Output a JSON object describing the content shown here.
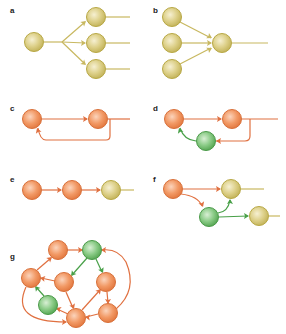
{
  "colors": {
    "yellow_fill": "#d8cc7a",
    "yellow_stroke": "#b8a845",
    "yellow_edge": "#c8b860",
    "orange_fill": "#f0925a",
    "orange_stroke": "#d8703a",
    "orange_edge": "#e07040",
    "green_fill": "#7cc47a",
    "green_stroke": "#4a9a48",
    "green_edge": "#48a048"
  },
  "panels": [
    {
      "id": "a",
      "label": "a",
      "label_pos": [
        10,
        14
      ],
      "title": "Single-input module (divergence)"
    },
    {
      "id": "b",
      "label": "b",
      "label_pos": [
        153,
        14
      ],
      "title": "Multi-input module (convergence)"
    },
    {
      "id": "c",
      "label": "c",
      "label_pos": [
        10,
        112
      ],
      "title": "Feedback loop"
    },
    {
      "id": "d",
      "label": "d",
      "label_pos": [
        153,
        112
      ],
      "title": "Feedback with inhibitory interneuron"
    },
    {
      "id": "e",
      "label": "e",
      "label_pos": [
        10,
        183
      ],
      "title": "Feed-forward chain"
    },
    {
      "id": "f",
      "label": "f",
      "label_pos": [
        153,
        183
      ],
      "title": "Feed-forward with interneuron"
    },
    {
      "id": "g",
      "label": "g",
      "label_pos": [
        10,
        260
      ],
      "title": "Recurrent network"
    }
  ],
  "nodes": [
    {
      "id": "a0",
      "panel": "a",
      "type": "yellow",
      "x": 34,
      "y": 42
    },
    {
      "id": "a1",
      "panel": "a",
      "type": "yellow",
      "x": 96,
      "y": 17
    },
    {
      "id": "a2",
      "panel": "a",
      "type": "yellow",
      "x": 96,
      "y": 43
    },
    {
      "id": "a3",
      "panel": "a",
      "type": "yellow",
      "x": 96,
      "y": 69
    },
    {
      "id": "b1",
      "panel": "b",
      "type": "yellow",
      "x": 172,
      "y": 17
    },
    {
      "id": "b2",
      "panel": "b",
      "type": "yellow",
      "x": 172,
      "y": 43
    },
    {
      "id": "b3",
      "panel": "b",
      "type": "yellow",
      "x": 172,
      "y": 69
    },
    {
      "id": "b0",
      "panel": "b",
      "type": "yellow",
      "x": 222,
      "y": 43
    },
    {
      "id": "c1",
      "panel": "c",
      "type": "orange",
      "x": 32,
      "y": 119
    },
    {
      "id": "c2",
      "panel": "c",
      "type": "orange",
      "x": 98,
      "y": 119
    },
    {
      "id": "d1",
      "panel": "d",
      "type": "orange",
      "x": 174,
      "y": 119
    },
    {
      "id": "d2",
      "panel": "d",
      "type": "orange",
      "x": 232,
      "y": 119
    },
    {
      "id": "d3",
      "panel": "d",
      "type": "green",
      "x": 206,
      "y": 141
    },
    {
      "id": "e1",
      "panel": "e",
      "type": "orange",
      "x": 32,
      "y": 190
    },
    {
      "id": "e2",
      "panel": "e",
      "type": "orange",
      "x": 72,
      "y": 190
    },
    {
      "id": "e3",
      "panel": "e",
      "type": "yellow",
      "x": 111,
      "y": 190
    },
    {
      "id": "f1",
      "panel": "f",
      "type": "orange",
      "x": 173,
      "y": 189
    },
    {
      "id": "f2",
      "panel": "f",
      "type": "yellow",
      "x": 231,
      "y": 189
    },
    {
      "id": "f3",
      "panel": "f",
      "type": "green",
      "x": 209,
      "y": 217
    },
    {
      "id": "f4",
      "panel": "f",
      "type": "yellow",
      "x": 259,
      "y": 216
    },
    {
      "id": "g1",
      "panel": "g",
      "type": "orange",
      "x": 58,
      "y": 250
    },
    {
      "id": "g2",
      "panel": "g",
      "type": "green",
      "x": 92,
      "y": 250
    },
    {
      "id": "g3",
      "panel": "g",
      "type": "orange",
      "x": 31,
      "y": 278
    },
    {
      "id": "g4",
      "panel": "g",
      "type": "orange",
      "x": 64,
      "y": 282
    },
    {
      "id": "g5",
      "panel": "g",
      "type": "orange",
      "x": 106,
      "y": 282
    },
    {
      "id": "g6",
      "panel": "g",
      "type": "green",
      "x": 48,
      "y": 305
    },
    {
      "id": "g7",
      "panel": "g",
      "type": "orange",
      "x": 76,
      "y": 318
    },
    {
      "id": "g8",
      "panel": "g",
      "type": "orange",
      "x": 108,
      "y": 313
    }
  ],
  "edges": [
    {
      "panel": "a",
      "color": "yellow",
      "d": "M44,42 L62,42",
      "head": null
    },
    {
      "panel": "a",
      "color": "yellow",
      "d": "M62,42 L85,22",
      "head": {
        "x": 86,
        "y": 21,
        "angle": -40
      }
    },
    {
      "panel": "a",
      "color": "yellow",
      "d": "M62,42 L85,43",
      "head": {
        "x": 86,
        "y": 43,
        "angle": 0
      }
    },
    {
      "panel": "a",
      "color": "yellow",
      "d": "M62,42 L85,64",
      "head": {
        "x": 86,
        "y": 65,
        "angle": 40
      }
    },
    {
      "panel": "a",
      "color": "yellow",
      "d": "M106,17 L130,17",
      "head": null
    },
    {
      "panel": "a",
      "color": "yellow",
      "d": "M106,43 L130,43",
      "head": null
    },
    {
      "panel": "a",
      "color": "yellow",
      "d": "M106,69 L130,69",
      "head": null
    },
    {
      "panel": "b",
      "color": "yellow",
      "d": "M180,22 L211,38",
      "head": {
        "x": 212,
        "y": 38,
        "angle": 28
      }
    },
    {
      "panel": "b",
      "color": "yellow",
      "d": "M182,43 L211,43",
      "head": {
        "x": 212,
        "y": 43,
        "angle": 0
      }
    },
    {
      "panel": "b",
      "color": "yellow",
      "d": "M180,64 L211,48",
      "head": {
        "x": 212,
        "y": 48,
        "angle": -28
      }
    },
    {
      "panel": "b",
      "color": "yellow",
      "d": "M232,43 L268,43",
      "head": null
    },
    {
      "panel": "c",
      "color": "orange",
      "d": "M42,119 L87,119",
      "head": {
        "x": 88,
        "y": 119,
        "angle": 0
      }
    },
    {
      "panel": "c",
      "color": "orange",
      "d": "M108,119 L130,119",
      "head": null
    },
    {
      "panel": "c",
      "color": "orange",
      "d": "M110,119 L110,136 Q110,140 106,140 L46,140 Q40,140 38,128",
      "head": {
        "x": 37,
        "y": 128,
        "angle": -110
      }
    },
    {
      "panel": "d",
      "color": "orange",
      "d": "M184,119 L221,119",
      "head": {
        "x": 222,
        "y": 119,
        "angle": 0
      }
    },
    {
      "panel": "d",
      "color": "orange",
      "d": "M242,119 L278,119",
      "head": null
    },
    {
      "panel": "d",
      "color": "orange",
      "d": "M250,119 L250,136 Q250,141 245,141 L216,141",
      "head": {
        "x": 216,
        "y": 141,
        "angle": 180
      }
    },
    {
      "panel": "d",
      "color": "green",
      "d": "M196,141 Q184,140 180,128",
      "head": {
        "x": 179,
        "y": 128,
        "angle": -110
      }
    },
    {
      "panel": "e",
      "color": "orange",
      "d": "M42,190 L61,190",
      "head": {
        "x": 62,
        "y": 190,
        "angle": 0
      }
    },
    {
      "panel": "e",
      "color": "orange",
      "d": "M82,190 L100,190",
      "head": {
        "x": 101,
        "y": 190,
        "angle": 0
      }
    },
    {
      "panel": "e",
      "color": "yellow",
      "d": "M121,190 L134,190",
      "head": null
    },
    {
      "panel": "f",
      "color": "orange",
      "d": "M183,189 L220,189",
      "head": {
        "x": 221,
        "y": 189,
        "angle": 0
      }
    },
    {
      "panel": "f",
      "color": "yellow",
      "d": "M241,189 L264,189",
      "head": null
    },
    {
      "panel": "f",
      "color": "orange",
      "d": "M181,194 Q198,196 202,206",
      "head": {
        "x": 203,
        "y": 207,
        "angle": 70
      }
    },
    {
      "panel": "f",
      "color": "green",
      "d": "M218,213 Q228,212 230,200",
      "head": {
        "x": 230,
        "y": 199,
        "angle": -90
      }
    },
    {
      "panel": "f",
      "color": "green",
      "d": "M219,217 L248,216",
      "head": {
        "x": 249,
        "y": 216,
        "angle": 0
      }
    },
    {
      "panel": "f",
      "color": "yellow",
      "d": "M269,216 L280,216",
      "head": null
    },
    {
      "panel": "g",
      "color": "orange",
      "d": "M67,250 L82,250",
      "head": {
        "x": 83,
        "y": 250,
        "angle": 0
      }
    },
    {
      "panel": "g",
      "color": "orange",
      "d": "M37,270 L51,258",
      "head": {
        "x": 52,
        "y": 257,
        "angle": -40
      }
    },
    {
      "panel": "g",
      "color": "green",
      "d": "M87,258 L72,275",
      "head": {
        "x": 71,
        "y": 276,
        "angle": 130
      }
    },
    {
      "panel": "g",
      "color": "green",
      "d": "M96,259 L102,272",
      "head": {
        "x": 103,
        "y": 273,
        "angle": 65
      }
    },
    {
      "panel": "g",
      "color": "orange",
      "d": "M55,281 L41,278",
      "head": {
        "x": 40,
        "y": 278,
        "angle": 190
      }
    },
    {
      "panel": "g",
      "color": "green",
      "d": "M44,296 L36,287",
      "head": {
        "x": 35,
        "y": 286,
        "angle": -130
      }
    },
    {
      "panel": "g",
      "color": "orange",
      "d": "M66,292 L73,308",
      "head": {
        "x": 74,
        "y": 309,
        "angle": 68
      }
    },
    {
      "panel": "g",
      "color": "orange",
      "d": "M82,310 L100,290",
      "head": {
        "x": 101,
        "y": 289,
        "angle": -48
      }
    },
    {
      "panel": "g",
      "color": "orange",
      "d": "M107,292 L108,303",
      "head": {
        "x": 108,
        "y": 304,
        "angle": 90
      }
    },
    {
      "panel": "g",
      "color": "orange",
      "d": "M98,314 L86,317",
      "head": {
        "x": 85,
        "y": 317,
        "angle": 185
      }
    },
    {
      "panel": "g",
      "color": "orange",
      "d": "M68,314 L57,309",
      "head": {
        "x": 56,
        "y": 308,
        "angle": 200
      }
    },
    {
      "panel": "g",
      "color": "orange",
      "d": "M26,287 Q10,322 66,322",
      "head": {
        "x": 67,
        "y": 322,
        "angle": 0
      }
    },
    {
      "panel": "g",
      "color": "orange",
      "d": "M116,309 Q138,290 126,262 Q118,248 102,250",
      "head": {
        "x": 101,
        "y": 250,
        "angle": 180
      }
    }
  ]
}
